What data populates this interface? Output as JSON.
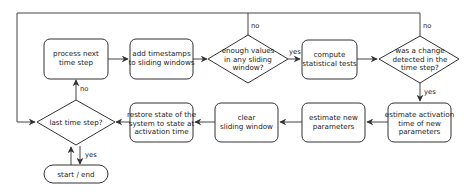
{
  "diagram": {
    "type": "flowchart",
    "colors": {
      "stroke": "#333333",
      "fill": "#ffffff",
      "text": "#222222"
    },
    "nodes": {
      "process": {
        "shape": "rounded-rect",
        "lines": [
          "process next",
          "time step"
        ]
      },
      "add_timestamps": {
        "shape": "rounded-rect",
        "lines": [
          "add timestamps",
          "to sliding windows"
        ]
      },
      "enough_values": {
        "shape": "diamond",
        "lines": [
          "enough values",
          "in any sliding",
          "window?"
        ]
      },
      "compute_tests": {
        "shape": "rounded-rect",
        "lines": [
          "compute",
          "statistical tests"
        ]
      },
      "change_detected": {
        "shape": "diamond",
        "lines": [
          "was a change",
          "detected in the",
          "time step?"
        ]
      },
      "estimate_activation": {
        "shape": "rounded-rect",
        "lines": [
          "estimate activation",
          "time of new",
          "parameters"
        ]
      },
      "estimate_params": {
        "shape": "rounded-rect",
        "lines": [
          "estimate new",
          "parameters"
        ]
      },
      "clear_window": {
        "shape": "rounded-rect",
        "lines": [
          "clear",
          "sliding window"
        ]
      },
      "restore_state": {
        "shape": "rounded-rect",
        "lines": [
          "restore state of the",
          "system to state at",
          "activation time"
        ]
      },
      "last_step": {
        "shape": "diamond",
        "lines": [
          "last time step?"
        ]
      },
      "start_end": {
        "shape": "pill",
        "lines": [
          "start / end"
        ]
      }
    },
    "edge_labels": {
      "last_no": "no",
      "last_yes": "yes",
      "enough_yes": "yes",
      "enough_no": "no",
      "change_no": "no",
      "change_yes": "yes"
    },
    "edges": [
      {
        "from": "start_end",
        "to": "last_step"
      },
      {
        "from": "last_step",
        "to": "start_end",
        "label": "yes"
      },
      {
        "from": "last_step",
        "to": "process",
        "label": "no"
      },
      {
        "from": "process",
        "to": "add_timestamps"
      },
      {
        "from": "add_timestamps",
        "to": "enough_values"
      },
      {
        "from": "enough_values",
        "to": "compute_tests",
        "label": "yes"
      },
      {
        "from": "enough_values",
        "to": "last_step",
        "label": "no"
      },
      {
        "from": "compute_tests",
        "to": "change_detected"
      },
      {
        "from": "change_detected",
        "to": "last_step",
        "label": "no"
      },
      {
        "from": "change_detected",
        "to": "estimate_activation",
        "label": "yes"
      },
      {
        "from": "estimate_activation",
        "to": "estimate_params"
      },
      {
        "from": "estimate_params",
        "to": "clear_window"
      },
      {
        "from": "clear_window",
        "to": "restore_state"
      },
      {
        "from": "restore_state",
        "to": "last_step"
      }
    ]
  }
}
